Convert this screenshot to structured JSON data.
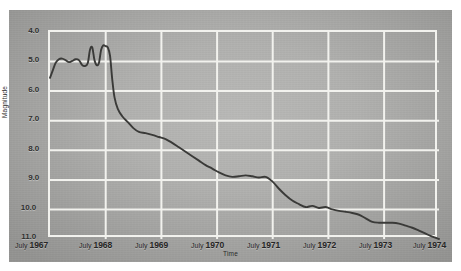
{
  "chart_data": {
    "type": "line",
    "title": "",
    "xlabel": "Time",
    "ylabel": "Magnitude",
    "grid": true,
    "legend": null,
    "y_inverted": true,
    "ylim": [
      4.0,
      11.0
    ],
    "yticks": [
      "4.0",
      "5.0",
      "6.0",
      "7.0",
      "8.0",
      "9.0",
      "10.0",
      "11.0"
    ],
    "ytick_values": [
      4.0,
      5.0,
      6.0,
      7.0,
      8.0,
      9.0,
      10.0,
      11.0
    ],
    "xlim": [
      "July 1967",
      "July 1974"
    ],
    "xticks": [
      "July 1967",
      "July 1968",
      "July 1969",
      "July 1970",
      "July 1971",
      "July 1972",
      "July 1973",
      "July 1974"
    ],
    "xtick_month": "July",
    "xtick_years": [
      "1967",
      "1968",
      "1969",
      "1970",
      "1971",
      "1972",
      "1973",
      "1974"
    ],
    "series": [
      {
        "name": "light curve",
        "color": "#3a3a38",
        "x": [
          1967.5,
          1967.55,
          1967.6,
          1967.66,
          1967.72,
          1967.78,
          1967.84,
          1967.9,
          1967.96,
          1968.02,
          1968.08,
          1968.13,
          1968.18,
          1968.22,
          1968.26,
          1968.3,
          1968.34,
          1968.38,
          1968.42,
          1968.46,
          1968.5,
          1968.54,
          1968.58,
          1968.62,
          1968.66,
          1968.72,
          1968.8,
          1968.9,
          1969.0,
          1969.1,
          1969.22,
          1969.34,
          1969.46,
          1969.58,
          1969.7,
          1969.82,
          1969.94,
          1970.06,
          1970.18,
          1970.3,
          1970.42,
          1970.54,
          1970.66,
          1970.78,
          1970.9,
          1971.02,
          1971.14,
          1971.26,
          1971.38,
          1971.5,
          1971.62,
          1971.74,
          1971.86,
          1971.98,
          1972.1,
          1972.22,
          1972.34,
          1972.46,
          1972.58,
          1972.7,
          1972.82,
          1972.94,
          1973.06,
          1973.18,
          1973.3,
          1973.42,
          1973.54,
          1973.66,
          1973.78,
          1973.9,
          1974.02,
          1974.14,
          1974.26,
          1974.38,
          1974.5
        ],
        "y": [
          5.55,
          5.3,
          5.05,
          4.92,
          4.9,
          4.95,
          5.02,
          4.98,
          4.92,
          4.95,
          5.12,
          5.15,
          5.05,
          4.6,
          4.52,
          4.95,
          5.12,
          5.05,
          4.6,
          4.45,
          4.48,
          4.52,
          4.8,
          5.6,
          6.2,
          6.6,
          6.85,
          7.05,
          7.25,
          7.38,
          7.42,
          7.48,
          7.55,
          7.62,
          7.75,
          7.9,
          8.05,
          8.2,
          8.35,
          8.5,
          8.62,
          8.75,
          8.85,
          8.9,
          8.88,
          8.85,
          8.88,
          8.92,
          8.9,
          9.05,
          9.3,
          9.52,
          9.7,
          9.82,
          9.92,
          9.88,
          9.95,
          9.92,
          10.0,
          10.05,
          10.08,
          10.12,
          10.18,
          10.3,
          10.42,
          10.45,
          10.45,
          10.45,
          10.48,
          10.55,
          10.62,
          10.72,
          10.82,
          10.92,
          11.0
        ]
      }
    ]
  },
  "axes": {
    "y_title": "Magnitude",
    "x_title": "Time"
  },
  "colors": {
    "curve": "#3a3a38",
    "grid": "#f2f2ee",
    "plot_background": "#b0b0ae",
    "figure_background": "#a8a8a6"
  }
}
